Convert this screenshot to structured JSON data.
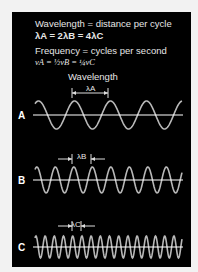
{
  "header": {
    "line1": "Wavelength = distance per cycle",
    "line2": "λA = 2λB = 4λC",
    "line3": "Frequency = cycles per second",
    "line4": "νA = ½νB = ¼νC"
  },
  "wavelength_label": "Wavelength",
  "waves": [
    {
      "label": "A",
      "lambda_label": "λA",
      "wavelength_px": 36
    },
    {
      "label": "B",
      "lambda_label": "λB",
      "wavelength_px": 18.5
    },
    {
      "label": "C",
      "lambda_label": "λC",
      "wavelength_px": 9.2
    }
  ],
  "colors": {
    "background": "#000000",
    "wave": "#b8b8b8",
    "axis": "#ffffff",
    "text": "#e6e6e6",
    "page": "#f2f2f2"
  }
}
